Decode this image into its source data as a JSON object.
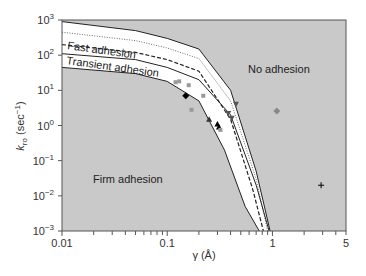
{
  "chart_data": {
    "type": "line",
    "title": "",
    "xlabel": "γ (Å)",
    "ylabel": "k_ro (sec⁻¹)",
    "xscale": "log",
    "yscale": "log",
    "xlim": [
      0.01,
      5
    ],
    "ylim": [
      0.001,
      1000
    ],
    "grid": false,
    "x_ticks": [
      "0.01",
      "0.1",
      "1",
      "5"
    ],
    "y_ticks": [
      "10^3",
      "10^2",
      "10^1",
      "10^0",
      "10^-1",
      "10^-2",
      "10^-3"
    ],
    "region_labels": [
      {
        "text": "Fast adhesion",
        "x": 0.012,
        "y": 200
      },
      {
        "text": "Transient adhesion",
        "x": 0.012,
        "y": 60
      },
      {
        "text": "No adhesion",
        "x": 0.7,
        "y": 12
      },
      {
        "text": "Firm adhesion",
        "x": 0.022,
        "y": 0.035
      }
    ],
    "series": [
      {
        "name": "upper boundary (solid)",
        "style": "solid",
        "x": [
          0.01,
          0.05,
          0.1,
          0.2,
          0.4,
          0.7,
          0.95
        ],
        "y": [
          900,
          500,
          300,
          150,
          10,
          0.05,
          0.001
        ]
      },
      {
        "name": "dotted",
        "style": "dotted",
        "x": [
          0.01,
          0.05,
          0.1,
          0.2,
          0.4,
          0.7,
          0.9
        ],
        "y": [
          450,
          260,
          160,
          80,
          5,
          0.03,
          0.001
        ]
      },
      {
        "name": "dashed",
        "style": "dashed",
        "x": [
          0.01,
          0.05,
          0.1,
          0.2,
          0.4,
          0.65,
          0.82
        ],
        "y": [
          200,
          120,
          75,
          35,
          1.5,
          0.015,
          0.001
        ]
      },
      {
        "name": "transient upper (solid)",
        "style": "solid",
        "x": [
          0.01,
          0.05,
          0.1,
          0.2,
          0.4,
          0.7,
          0.93
        ],
        "y": [
          110,
          75,
          45,
          20,
          2,
          0.02,
          0.001
        ]
      },
      {
        "name": "lower boundary (solid)",
        "style": "solid",
        "x": [
          0.01,
          0.05,
          0.1,
          0.2,
          0.35,
          0.55,
          0.75
        ],
        "y": [
          45,
          30,
          18,
          5,
          0.2,
          0.005,
          0.001
        ]
      }
    ],
    "points": [
      {
        "marker": "diamond",
        "color": "#000000",
        "x": 0.15,
        "y": 7
      },
      {
        "marker": "diamond",
        "color": "#888888",
        "x": 1.1,
        "y": 2.6
      },
      {
        "marker": "triangle-down",
        "color": "#555555",
        "x": 0.45,
        "y": 4
      },
      {
        "marker": "plus",
        "color": "#000000",
        "x": 2.9,
        "y": 0.02
      },
      {
        "marker": "square",
        "color": "#999999",
        "x": 0.12,
        "y": 17
      },
      {
        "marker": "square",
        "color": "#999999",
        "x": 0.13,
        "y": 18
      },
      {
        "marker": "square",
        "color": "#999999",
        "x": 0.16,
        "y": 14
      },
      {
        "marker": "square",
        "color": "#999999",
        "x": 0.22,
        "y": 7
      },
      {
        "marker": "square",
        "color": "#999999",
        "x": 0.17,
        "y": 2.8
      },
      {
        "marker": "triangle-up",
        "color": "#333333",
        "x": 0.25,
        "y": 1.5
      },
      {
        "marker": "triangle-up",
        "color": "#000000",
        "x": 0.3,
        "y": 1.1
      },
      {
        "marker": "triangle-up",
        "color": "#000000",
        "x": 0.31,
        "y": 0.9
      },
      {
        "marker": "square",
        "color": "#999999",
        "x": 0.32,
        "y": 0.75
      },
      {
        "marker": "triangle-down",
        "color": "#555555",
        "x": 0.38,
        "y": 2.2
      },
      {
        "marker": "triangle-down",
        "color": "#555555",
        "x": 0.41,
        "y": 1.6
      }
    ]
  }
}
